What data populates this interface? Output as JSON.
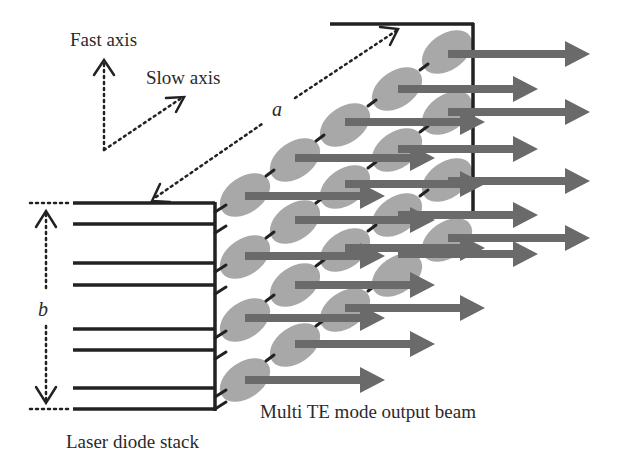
{
  "labels": {
    "fast_axis": "Fast axis",
    "slow_axis": "Slow axis",
    "dimension_a": "a",
    "dimension_b": "b",
    "output_beam": "Multi TE mode output beam",
    "laser_stack": "Laser diode stack"
  },
  "colors": {
    "line": "#222222",
    "ellipse": "#a8a8a8",
    "arrow": "#6a6a6a",
    "text": "#2a2a2a",
    "background": "#ffffff"
  },
  "stack": {
    "bar_y": [
      203,
      224,
      263,
      285,
      329,
      350,
      388,
      409
    ],
    "bar_x_start": 73,
    "bar_x_end": 215
  },
  "emitter_rows": 4,
  "ellipses_per_row": 5,
  "output_arrows": [
    {
      "x1": 448,
      "x2": 590,
      "y": 54
    },
    {
      "x1": 398,
      "x2": 538,
      "y": 89
    },
    {
      "x1": 448,
      "x2": 590,
      "y": 112
    },
    {
      "x1": 345,
      "x2": 485,
      "y": 122
    },
    {
      "x1": 398,
      "x2": 538,
      "y": 149
    },
    {
      "x1": 295,
      "x2": 435,
      "y": 158
    },
    {
      "x1": 448,
      "x2": 590,
      "y": 181
    },
    {
      "x1": 345,
      "x2": 485,
      "y": 184
    },
    {
      "x1": 245,
      "x2": 385,
      "y": 196
    },
    {
      "x1": 398,
      "x2": 538,
      "y": 215
    },
    {
      "x1": 295,
      "x2": 435,
      "y": 220
    },
    {
      "x1": 448,
      "x2": 590,
      "y": 238
    },
    {
      "x1": 345,
      "x2": 485,
      "y": 248
    },
    {
      "x1": 245,
      "x2": 385,
      "y": 256
    },
    {
      "x1": 398,
      "x2": 538,
      "y": 254
    },
    {
      "x1": 295,
      "x2": 435,
      "y": 285
    },
    {
      "x1": 345,
      "x2": 485,
      "y": 308
    },
    {
      "x1": 245,
      "x2": 385,
      "y": 318
    },
    {
      "x1": 295,
      "x2": 435,
      "y": 344
    },
    {
      "x1": 245,
      "x2": 385,
      "y": 380
    }
  ]
}
